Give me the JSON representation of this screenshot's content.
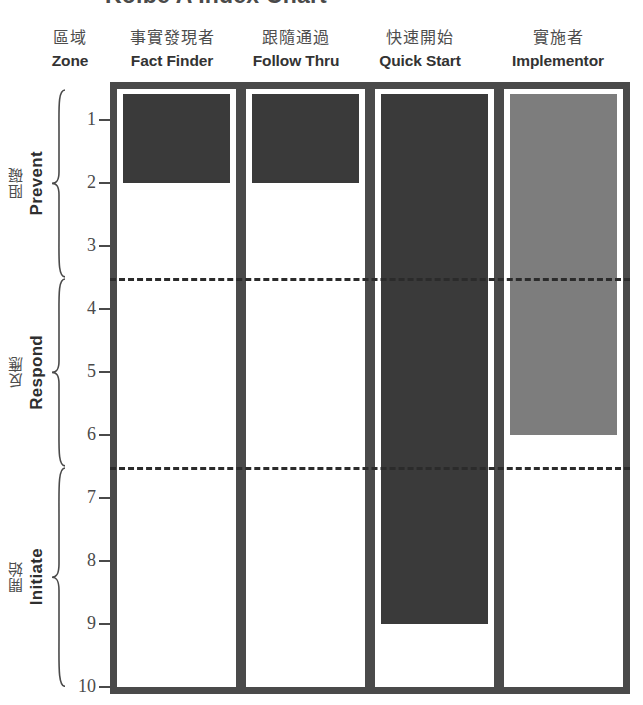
{
  "title": "Kolbe A Index Chart",
  "axis_header": {
    "cn": "區域",
    "en": "Zone"
  },
  "columns": [
    {
      "cn": "事實發現者",
      "en": "Fact Finder",
      "value": 2,
      "color": "#3a3a3a"
    },
    {
      "cn": "跟隨通過",
      "en": "Follow Thru",
      "value": 2,
      "color": "#3a3a3a"
    },
    {
      "cn": "快速開始",
      "en": "Quick Start",
      "value": 9,
      "color": "#3a3a3a"
    },
    {
      "cn": "實施者",
      "en": "Implementor",
      "value": 6,
      "color": "#7d7d7d"
    }
  ],
  "y_ticks": [
    "1",
    "2",
    "3",
    "4",
    "5",
    "6",
    "7",
    "8",
    "9",
    "10"
  ],
  "zones": [
    {
      "cn": "阻礙",
      "en": "Prevent",
      "from": 0.5,
      "to": 3.5
    },
    {
      "cn": "反應",
      "en": "Respond",
      "from": 3.5,
      "to": 6.5
    },
    {
      "cn": "開始",
      "en": "Initiate",
      "from": 6.5,
      "to": 10.0
    }
  ],
  "zone_splits": [
    3.5,
    6.5
  ],
  "colors": {
    "frame": "#4a4a4a",
    "bar_dark": "#3a3a3a",
    "bar_light": "#7d7d7d",
    "dashed_line": "#2b2b2b",
    "background": "#ffffff"
  },
  "chart_data": {
    "type": "bar",
    "title": "Kolbe A Index Chart",
    "xlabel": "",
    "ylabel": "Zone",
    "orientation": "vertical",
    "y_inverted": true,
    "ylim": [
      0.5,
      10
    ],
    "grid": false,
    "legend": false,
    "categories": [
      "Fact Finder",
      "Follow Thru",
      "Quick Start",
      "Implementor"
    ],
    "categories_cn": [
      "事實發現者",
      "跟隨通過",
      "快速開始",
      "實施者"
    ],
    "values": [
      2,
      2,
      9,
      6
    ],
    "bar_colors": [
      "#3a3a3a",
      "#3a3a3a",
      "#3a3a3a",
      "#7d7d7d"
    ],
    "tick_labels": [
      "1",
      "2",
      "3",
      "4",
      "5",
      "6",
      "7",
      "8",
      "9",
      "10"
    ],
    "annotations": [
      {
        "type": "dashed-hline",
        "y": 3.5,
        "label": "Prevent / Respond boundary"
      },
      {
        "type": "dashed-hline",
        "y": 6.5,
        "label": "Respond / Initiate boundary"
      }
    ],
    "zone_bands": [
      {
        "name": "Prevent",
        "name_cn": "阻礙",
        "range": [
          0.5,
          3.5
        ]
      },
      {
        "name": "Respond",
        "name_cn": "反應",
        "range": [
          3.5,
          6.5
        ]
      },
      {
        "name": "Initiate",
        "name_cn": "開始",
        "range": [
          6.5,
          10.0
        ]
      }
    ]
  }
}
